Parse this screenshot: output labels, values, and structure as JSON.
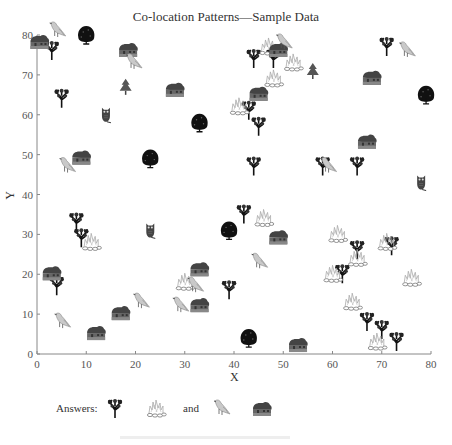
{
  "chart_data": {
    "type": "scatter",
    "title": "Co-location Patterns—Sample Data",
    "xlabel": "X",
    "ylabel": "Y",
    "xlim": [
      0,
      80
    ],
    "ylim": [
      0,
      80
    ],
    "xticks": [
      "0",
      "10",
      "20",
      "30",
      "40",
      "50",
      "60",
      "70",
      "80"
    ],
    "yticks": [
      "0",
      "10",
      "20",
      "30",
      "40",
      "50",
      "60",
      "70",
      "80"
    ],
    "grid": false,
    "legend": "none",
    "series": [
      {
        "name": "bush-tree",
        "points": [
          [
            3,
            76
          ],
          [
            5,
            64
          ],
          [
            4,
            17
          ],
          [
            8,
            33
          ],
          [
            9,
            29
          ],
          [
            44,
            74
          ],
          [
            48,
            74
          ],
          [
            43,
            61
          ],
          [
            45,
            57
          ],
          [
            44,
            47
          ],
          [
            42,
            35
          ],
          [
            39,
            16
          ],
          [
            58,
            47
          ],
          [
            65,
            47
          ],
          [
            72,
            27
          ],
          [
            71,
            77
          ],
          [
            65,
            26
          ],
          [
            62,
            20
          ],
          [
            67,
            8
          ],
          [
            70,
            6
          ],
          [
            73,
            3
          ]
        ]
      },
      {
        "name": "round-tree",
        "points": [
          [
            10,
            80
          ],
          [
            33,
            58
          ],
          [
            23,
            49
          ],
          [
            39,
            31
          ],
          [
            79,
            65
          ],
          [
            43,
            4
          ]
        ]
      },
      {
        "name": "pine-tree",
        "points": [
          [
            18,
            67
          ],
          [
            56,
            71
          ]
        ]
      },
      {
        "name": "fire",
        "points": [
          [
            47,
            77
          ],
          [
            48,
            69
          ],
          [
            52,
            73
          ],
          [
            41,
            62
          ],
          [
            11,
            28
          ],
          [
            46,
            34
          ],
          [
            30,
            18
          ],
          [
            61,
            30
          ],
          [
            71,
            28
          ],
          [
            65,
            24
          ],
          [
            60,
            20
          ],
          [
            76,
            19
          ],
          [
            64,
            13
          ],
          [
            69,
            3
          ]
        ]
      },
      {
        "name": "house",
        "points": [
          [
            0.5,
            78
          ],
          [
            18.5,
            76
          ],
          [
            28,
            66
          ],
          [
            9,
            49
          ],
          [
            3,
            20
          ],
          [
            12,
            5
          ],
          [
            17,
            10
          ],
          [
            33,
            21
          ],
          [
            33,
            12
          ],
          [
            49,
            76
          ],
          [
            68,
            69
          ],
          [
            45,
            65
          ],
          [
            49,
            29
          ],
          [
            53,
            2
          ],
          [
            67,
            53
          ]
        ]
      },
      {
        "name": "bird",
        "points": [
          [
            4,
            81
          ],
          [
            19.5,
            73
          ],
          [
            6,
            47
          ],
          [
            5,
            8
          ],
          [
            21,
            13
          ],
          [
            32,
            17
          ],
          [
            29,
            12
          ],
          [
            45,
            23
          ],
          [
            50,
            78
          ],
          [
            59,
            47
          ],
          [
            75,
            76
          ]
        ]
      },
      {
        "name": "owl",
        "points": [
          [
            14,
            60
          ],
          [
            23,
            31
          ],
          [
            78,
            43
          ]
        ]
      }
    ]
  },
  "answers": {
    "label": "Answers:",
    "and_label": "and",
    "pair1": [
      "bush-tree",
      "fire"
    ],
    "pair2": [
      "bird",
      "house"
    ]
  }
}
